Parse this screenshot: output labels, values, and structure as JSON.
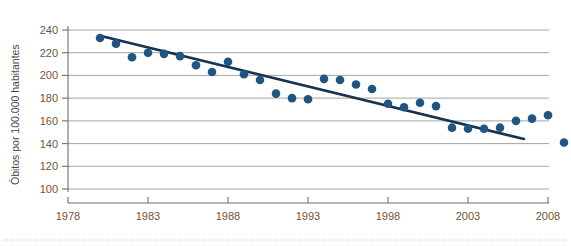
{
  "chart_data": {
    "type": "scatter",
    "title": "",
    "subtitle": "",
    "xlabel": "",
    "ylabel": "Óbitos por 100.000 habitantes",
    "xlim": [
      1978,
      2008
    ],
    "ylim": [
      100,
      240
    ],
    "grid": true,
    "legend": null,
    "x_ticks": [
      1978,
      1983,
      1988,
      1993,
      1998,
      2003,
      2008
    ],
    "x_tick_labels": [
      "1978",
      "1983",
      "1988",
      "1993",
      "1998",
      "2003",
      "2008"
    ],
    "y_ticks": [
      100,
      120,
      140,
      160,
      180,
      200,
      220,
      240
    ],
    "y_tick_labels": [
      "100",
      "120",
      "140",
      "160",
      "180",
      "200",
      "220",
      "240"
    ],
    "marker_color": "#1f5582",
    "trendline_color": "#16334f",
    "gridline_color": "#9a9a9a",
    "axis_color": "#6e6e6e",
    "series": [
      {
        "name": "Óbitos por 100.000 habitantes",
        "marker": "circle",
        "points": [
          {
            "x": 1980,
            "y": 233
          },
          {
            "x": 1981,
            "y": 228
          },
          {
            "x": 1982,
            "y": 216
          },
          {
            "x": 1983,
            "y": 220
          },
          {
            "x": 1984,
            "y": 219
          },
          {
            "x": 1985,
            "y": 217
          },
          {
            "x": 1986,
            "y": 209
          },
          {
            "x": 1987,
            "y": 203
          },
          {
            "x": 1988,
            "y": 212
          },
          {
            "x": 1989,
            "y": 201
          },
          {
            "x": 1990,
            "y": 196
          },
          {
            "x": 1991,
            "y": 184
          },
          {
            "x": 1992,
            "y": 180
          },
          {
            "x": 1993,
            "y": 179
          },
          {
            "x": 1994,
            "y": 197
          },
          {
            "x": 1995,
            "y": 196
          },
          {
            "x": 1996,
            "y": 192
          },
          {
            "x": 1997,
            "y": 188
          },
          {
            "x": 1998,
            "y": 175
          },
          {
            "x": 1999,
            "y": 172
          },
          {
            "x": 2000,
            "y": 176
          },
          {
            "x": 2001,
            "y": 173
          },
          {
            "x": 2002,
            "y": 154
          },
          {
            "x": 2003,
            "y": 153
          },
          {
            "x": 2004,
            "y": 153
          },
          {
            "x": 2005,
            "y": 154
          },
          {
            "x": 2006,
            "y": 160
          },
          {
            "x": 2007,
            "y": 162
          },
          {
            "x": 2008,
            "y": 165
          },
          {
            "x": 2009,
            "y": 141
          }
        ]
      }
    ],
    "trendline": {
      "type": "linear",
      "start": {
        "x": 1980,
        "y": 235
      },
      "end": {
        "x": 2006.5,
        "y": 144
      }
    }
  }
}
